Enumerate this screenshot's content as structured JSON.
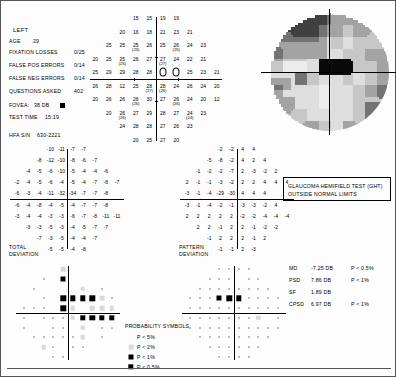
{
  "patient": {
    "eye": "LEFT",
    "age_label": "AGE",
    "age_value": "29",
    "reliability": [
      {
        "label": "FIXATION LOSSES",
        "value": "0/25"
      },
      {
        "label": "FALSE POS ERRORS",
        "value": "0/14"
      },
      {
        "label": "FALSE NEG ERRORS",
        "value": "0/14"
      },
      {
        "label": "QUESTIONS ASKED",
        "value": "402"
      }
    ],
    "fovea_label": "FOVEA:",
    "fovea_value": "38 DB",
    "test_time_label": "TEST TIME",
    "test_time_value": "15:19",
    "serial_label": "HFA S/N",
    "serial_value": "630-2221"
  },
  "sections": {
    "total_deviation": [
      "TOTAL",
      "DEVIATION"
    ],
    "pattern_deviation": [
      "PATTERN",
      "DEVIATION"
    ],
    "prob_symbols_title": "PROBABILITY SYMBOLS"
  },
  "ght": {
    "title": "GLAUCOMA HEMIFIELD TEST (GHT)",
    "result": "OUTSIDE NORMAL LIMITS"
  },
  "indices": [
    {
      "name": "MD",
      "value": "-7.25 DB",
      "p": "P < 0.5%"
    },
    {
      "name": "PSD",
      "value": "7.86 DB",
      "p": "P <  1%"
    },
    {
      "name": "SF",
      "value": "1.89 DB",
      "p": ""
    },
    {
      "name": "CPSD",
      "value": "6.97 DB",
      "p": "P <  1%"
    }
  ],
  "legend": [
    {
      "sym": "p5",
      "label": "P <  5%"
    },
    {
      "sym": "p2",
      "label": "P <  2%"
    },
    {
      "sym": "p1",
      "label": "P <  1%"
    },
    {
      "sym": "p05",
      "label": "P < 0.5%"
    }
  ],
  "chart_data": {
    "type": "heatmap",
    "xlabel": "Horizontal eccentricity (degrees)",
    "ylabel": "Vertical eccentricity (degrees)",
    "units": "dB",
    "grid": "30-2 (76 test points)",
    "threshold_rows": [
      {
        "y": 27,
        "x": [
          -9,
          -3,
          3,
          9
        ],
        "values": [
          15,
          15,
          19,
          19
        ],
        "second": [
          null,
          null,
          null,
          null
        ]
      },
      {
        "y": 21,
        "x": [
          -15,
          -9,
          -3,
          3,
          9,
          15
        ],
        "values": [
          20,
          16,
          18,
          21,
          23,
          21
        ],
        "second": [
          null,
          null,
          null,
          null,
          null,
          null
        ]
      },
      {
        "y": 15,
        "x": [
          -21,
          -15,
          -9,
          -3,
          3,
          9,
          15,
          21
        ],
        "values": [
          25,
          25,
          25,
          26,
          25,
          26,
          24,
          23
        ],
        "second": [
          null,
          null,
          25,
          null,
          null,
          25,
          null,
          null
        ]
      },
      {
        "y": 9,
        "x": [
          -27,
          -21,
          -15,
          -9,
          -3,
          3,
          9,
          15,
          21,
          27
        ],
        "values": [
          20,
          25,
          25,
          26,
          27,
          27,
          24,
          22,
          21,
          null
        ],
        "second": [
          null,
          null,
          25,
          null,
          null,
          27,
          null,
          null,
          null,
          null
        ]
      },
      {
        "y": 3,
        "x": [
          -27,
          -21,
          -15,
          -9,
          -3,
          3,
          9,
          15,
          21,
          27
        ],
        "values": [
          25,
          29,
          29,
          28,
          28,
          0,
          0,
          25,
          23,
          21
        ],
        "second": [
          null,
          null,
          null,
          null,
          null,
          null,
          null,
          null,
          null,
          null
        ]
      },
      {
        "y": -3,
        "x": [
          -27,
          -21,
          -15,
          -9,
          -3,
          3,
          9,
          15,
          21,
          27
        ],
        "values": [
          26,
          28,
          12,
          25,
          28,
          28,
          24,
          26,
          24,
          20
        ],
        "second": [
          null,
          null,
          null,
          null,
          27,
          26,
          null,
          null,
          null,
          null
        ]
      },
      {
        "y": -9,
        "x": [
          -27,
          -21,
          -15,
          -9,
          -3,
          3,
          9,
          15,
          21,
          27
        ],
        "values": [
          20,
          26,
          26,
          26,
          30,
          27,
          26,
          24,
          20,
          12
        ],
        "second": [
          null,
          null,
          null,
          26,
          null,
          null,
          26,
          null,
          null,
          null
        ]
      },
      {
        "y": -15,
        "x": [
          -21,
          -15,
          -9,
          -3,
          3,
          9,
          15,
          21
        ],
        "values": [
          20,
          26,
          27,
          29,
          28,
          27,
          24,
          23
        ],
        "second": [
          null,
          26,
          null,
          null,
          null,
          null,
          24,
          null
        ]
      },
      {
        "y": -21,
        "x": [
          -15,
          -9,
          -3,
          3,
          9,
          15
        ],
        "values": [
          24,
          28,
          28,
          27,
          26,
          23
        ],
        "second": [
          null,
          null,
          null,
          null,
          null,
          null
        ]
      },
      {
        "y": -27,
        "x": [
          -9,
          -3,
          3,
          9
        ],
        "values": [
          20,
          25,
          27,
          20
        ],
        "second": [
          null,
          null,
          null,
          null
        ]
      }
    ],
    "total_deviation_rows": [
      {
        "y": 27,
        "values": [
          -10,
          -11,
          -7,
          -7
        ]
      },
      {
        "y": 21,
        "values": [
          -8,
          -12,
          -10,
          -8,
          -6,
          -7
        ]
      },
      {
        "y": 15,
        "values": [
          -4,
          -5,
          -6,
          -10,
          -5,
          -4,
          -4,
          -6
        ]
      },
      {
        "y": 9,
        "values": [
          -2,
          -4,
          -5,
          -6,
          -4,
          -5,
          -4,
          -7,
          -8,
          -7
        ]
      },
      {
        "y": 3,
        "values": [
          -6,
          -3,
          -4,
          -11,
          -32,
          -34,
          -7,
          -7,
          -8,
          null
        ]
      },
      {
        "y": -3,
        "values": [
          -6,
          -4,
          -8,
          -4,
          -5,
          -4,
          -7,
          -7,
          -8,
          null
        ]
      },
      {
        "y": -9,
        "values": [
          -3,
          -4,
          -4,
          -3,
          -3,
          -6,
          -7,
          -8,
          -11,
          -11
        ]
      },
      {
        "y": -15,
        "values": [
          -3,
          -3,
          -5,
          -3,
          -4,
          -5,
          -7,
          -7
        ]
      },
      {
        "y": -21,
        "values": [
          -7,
          -3,
          -5,
          -4,
          -4,
          -7
        ]
      },
      {
        "y": -27,
        "values": [
          -5,
          -5,
          -4,
          -8
        ]
      }
    ],
    "pattern_deviation_rows": [
      {
        "y": 27,
        "values": [
          -2,
          -2,
          4,
          4
        ]
      },
      {
        "y": 21,
        "values": [
          -5,
          -8,
          -2,
          4,
          2,
          4
        ]
      },
      {
        "y": 15,
        "values": [
          -1,
          -2,
          -2,
          -7,
          2,
          -3,
          -2,
          2
        ]
      },
      {
        "y": 9,
        "values": [
          2,
          -1,
          -1,
          -3,
          -2,
          2,
          2,
          4,
          4,
          4
        ]
      },
      {
        "y": 3,
        "values": [
          -3,
          -1,
          -4,
          -29,
          -30,
          4,
          4,
          4,
          null,
          null
        ]
      },
      {
        "y": -3,
        "values": [
          -3,
          -1,
          -4,
          -2,
          -1,
          -3,
          -3,
          -2,
          4,
          null
        ]
      },
      {
        "y": -9,
        "values": [
          2,
          2,
          2,
          2,
          2,
          -2,
          -2,
          -4,
          -4,
          -4
        ]
      },
      {
        "y": -15,
        "values": [
          2,
          2,
          -1,
          2,
          2,
          -1,
          -2,
          -2
        ]
      },
      {
        "y": -21,
        "values": [
          -1,
          2,
          2,
          2,
          -1,
          2
        ]
      },
      {
        "y": -27,
        "values": [
          -1,
          -1,
          2,
          -3
        ]
      }
    ],
    "total_deviation_prob_rows": [
      {
        "y": 27,
        "syms": [
          "p5",
          "p2",
          "p5",
          "p5"
        ]
      },
      {
        "y": 21,
        "syms": [
          "dot",
          "p5",
          "p1",
          "p5",
          "p5",
          "p5"
        ]
      },
      {
        "y": 15,
        "syms": [
          "dot",
          "p5",
          "p5",
          "p5",
          "p5",
          "p2",
          "p5",
          "dot"
        ]
      },
      {
        "y": 9,
        "syms": [
          "p5",
          "p5",
          "dot",
          "p5",
          "p05",
          "p05",
          "p05",
          "p05",
          "p2",
          "dot"
        ]
      },
      {
        "y": 3,
        "syms": [
          "dot",
          "dot",
          "dot",
          "p5",
          "p05",
          "p2",
          "p5",
          "p2",
          "p2",
          "p2"
        ]
      },
      {
        "y": -3,
        "syms": [
          "dot",
          "p5",
          "dot",
          "dot",
          "dot",
          "p2",
          "p05",
          "p05",
          "p05",
          "p05"
        ]
      },
      {
        "y": -9,
        "syms": [
          "dot",
          "p5",
          "p5",
          "dot",
          "dot",
          "p5",
          "p2",
          "p5",
          "dot",
          "dot"
        ]
      },
      {
        "y": -15,
        "syms": [
          "dot",
          "dot",
          "dot",
          "dot",
          "dot",
          "p2",
          "p5",
          "dot"
        ]
      },
      {
        "y": -21,
        "syms": [
          "p2",
          "dot",
          "p5",
          "dot",
          "dot",
          "p5"
        ]
      },
      {
        "y": -27,
        "syms": [
          "dot",
          "dot",
          "p5",
          "p5"
        ]
      }
    ],
    "pattern_deviation_prob_rows": [
      {
        "y": 27,
        "syms": [
          "dot",
          "dot",
          "dot",
          "dot"
        ]
      },
      {
        "y": 21,
        "syms": [
          "dot",
          "dot",
          "dot",
          "p5",
          "dot",
          "dot"
        ]
      },
      {
        "y": 15,
        "syms": [
          "dot",
          "dot",
          "dot",
          "dot",
          "dot",
          "dot",
          "dot",
          "dot"
        ]
      },
      {
        "y": 9,
        "syms": [
          "dot",
          "dot",
          "dot",
          "p1",
          "p05",
          "p05",
          "dot",
          "dot",
          "dot",
          "dot"
        ]
      },
      {
        "y": 3,
        "syms": [
          "dot",
          "dot",
          "dot",
          "dot",
          "dot",
          "dot",
          "dot",
          "dot",
          "dot",
          "dot"
        ]
      },
      {
        "y": -3,
        "syms": [
          "dot",
          "dot",
          "dot",
          "dot",
          "dot",
          "dot",
          "dot",
          "p2",
          "p5",
          "dot"
        ]
      },
      {
        "y": -9,
        "syms": [
          "dot",
          "dot",
          "dot",
          "dot",
          "dot",
          "dot",
          "dot",
          "dot",
          "dot",
          "dot"
        ]
      },
      {
        "y": -15,
        "syms": [
          "dot",
          "dot",
          "dot",
          "dot",
          "dot",
          "dot",
          "dot",
          "dot"
        ]
      },
      {
        "y": -21,
        "syms": [
          "dot",
          "dot",
          "dot",
          "dot",
          "dot",
          "dot"
        ]
      },
      {
        "y": -27,
        "syms": [
          "dot",
          "dot",
          "dot",
          "dot"
        ]
      }
    ],
    "grayscale_description": "Superior nasal arcuate defect with dense central/paracentral scotoma, left eye"
  }
}
